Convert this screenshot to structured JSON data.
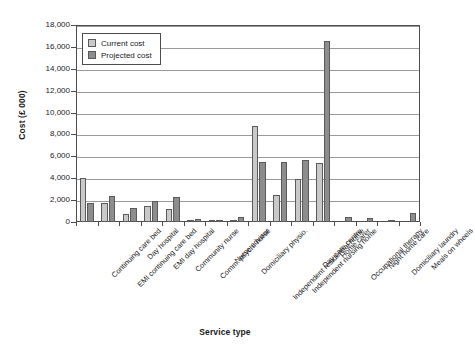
{
  "chart_data": {
    "type": "bar",
    "title": "",
    "xlabel": "Service type",
    "ylabel": "Cost (£ 000)",
    "ylim": [
      0,
      18000
    ],
    "ytick_step": 2000,
    "yticks": [
      "18,000",
      "16,000",
      "14,000",
      "12,000",
      "10,000",
      "8,000",
      "6,000",
      "4,000",
      "2,000",
      "0"
    ],
    "grid": true,
    "legend_position": "upper-left-inside",
    "categories": [
      "Continuing care bed",
      "EMI continuing care bed",
      "Day hospital",
      "EMI day hospital",
      "Community nurse",
      "Comm. psych. nurse",
      "Nurse advisor",
      "Domiciliary physio.",
      "Independent residential home",
      "Independent nursing home",
      "Day care centre",
      "Home carer",
      "Occupational therapy",
      "Night home care",
      "Domiciliary laundry",
      "Meals on wheels"
    ],
    "series": [
      {
        "name": "Current cost",
        "color": "#c9c9c9",
        "values": [
          4050,
          1750,
          700,
          1500,
          1150,
          180,
          120,
          200,
          8800,
          2500,
          3900,
          5350,
          0,
          0,
          0,
          0
        ]
      },
      {
        "name": "Projected cost",
        "color": "#8d8d8d",
        "values": [
          1750,
          2350,
          1250,
          1950,
          2300,
          230,
          190,
          470,
          5450,
          5450,
          5700,
          16500,
          420,
          370,
          120,
          820
        ]
      }
    ]
  },
  "legend": {
    "items": [
      {
        "label": "Current cost"
      },
      {
        "label": "Projected cost"
      }
    ]
  }
}
